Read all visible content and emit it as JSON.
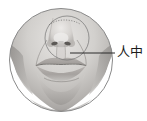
{
  "figure": {
    "type": "anatomical-illustration",
    "rendering": "grayscale photographic shading inside circular frame",
    "frame": {
      "shape": "circle",
      "center_x": 61,
      "center_y": 60,
      "radius": 52,
      "stroke_color": "#8a8a8a",
      "fill_background": "#ffffff"
    },
    "inner_guide": {
      "shape": "circle",
      "label": "nose-mouth region guide circle",
      "center_x": 67,
      "center_y": 38,
      "radius": 22,
      "stroke_color": "#6f6f6f"
    },
    "callout": {
      "label": "人中",
      "meaning": "philtrum",
      "leader_line": {
        "from_x": 70,
        "from_y": 53,
        "to_x": 115,
        "to_y": 53,
        "stroke_color": "#2b2b2b"
      },
      "text_color": "#1c1c1c"
    },
    "palette": {
      "skin_light": "#e2e0de",
      "skin_mid": "#bdbbb8",
      "skin_shadow": "#9a9794",
      "skin_dark": "#7d7a77",
      "lip_mid": "#a9a5a2",
      "lip_dark": "#8d8986",
      "nostril": "#5c5956",
      "highlight": "#f4f3f2",
      "white_gap": "#ffffff",
      "outline": "#8a8a8a"
    }
  }
}
